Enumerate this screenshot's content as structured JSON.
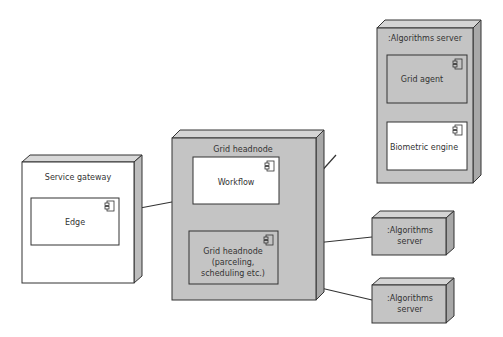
{
  "diagram": {
    "type": "UML deployment diagram",
    "colors": {
      "node_gray": "#c4c4c4",
      "node_white": "#ffffff",
      "stroke": "#333333"
    },
    "nodes": [
      {
        "id": "service_gateway",
        "label": "Service gateway",
        "fill": "white",
        "components": [
          {
            "id": "edge",
            "label": "Edge"
          }
        ]
      },
      {
        "id": "grid_headnode",
        "label": "Grid headnode",
        "fill": "gray",
        "components": [
          {
            "id": "workflow",
            "label": "Workflow"
          },
          {
            "id": "grid_headnode_comp",
            "label_lines": [
              "Grid headnode",
              "(parceling,",
              "scheduling etc.)"
            ]
          }
        ]
      },
      {
        "id": "algorithms_server_main",
        "label": ":Algorithms server",
        "fill": "gray",
        "components": [
          {
            "id": "grid_agent",
            "label": "Grid agent"
          },
          {
            "id": "biometric_engine",
            "label": "Biometric engine"
          }
        ]
      },
      {
        "id": "algorithms_server_1",
        "label_lines": [
          ":Algorithms",
          "server"
        ],
        "fill": "gray"
      },
      {
        "id": "algorithms_server_2",
        "label_lines": [
          ":Algorithms",
          "server"
        ],
        "fill": "gray"
      }
    ],
    "connections": [
      {
        "from": "edge",
        "to": "workflow"
      },
      {
        "from": "workflow",
        "to": "grid_headnode_comp"
      },
      {
        "from": "grid_headnode_comp",
        "to": "grid_agent"
      },
      {
        "from": "grid_headnode_comp",
        "to": "algorithms_server_1"
      },
      {
        "from": "grid_headnode_comp",
        "to": "algorithms_server_2"
      }
    ]
  }
}
